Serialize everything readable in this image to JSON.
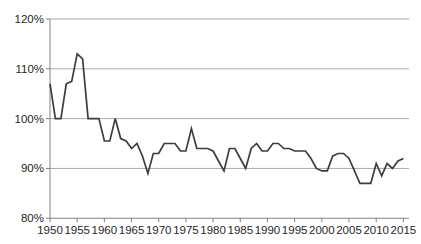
{
  "chart_data": {
    "type": "line",
    "title": "",
    "subtitle": "",
    "xlabel": "",
    "ylabel": "",
    "legend": "none",
    "grid": "horizontal",
    "ylim": [
      80,
      120
    ],
    "xlim": [
      1950,
      2015
    ],
    "y_tick_labels": [
      "120%",
      "110%",
      "100%",
      "90%",
      "80%"
    ],
    "y_tick_values": [
      120,
      110,
      100,
      90,
      80
    ],
    "x_tick_labels": [
      "1950",
      "1955",
      "1960",
      "1965",
      "1970",
      "1975",
      "1980",
      "1985",
      "1990",
      "1995",
      "2000",
      "2005",
      "2010",
      "2015"
    ],
    "x_tick_values": [
      1950,
      1955,
      1960,
      1965,
      1970,
      1975,
      1980,
      1985,
      1990,
      1995,
      2000,
      2005,
      2010,
      2015
    ],
    "x": [
      1950,
      1951,
      1952,
      1953,
      1954,
      1955,
      1956,
      1957,
      1958,
      1959,
      1960,
      1961,
      1962,
      1963,
      1964,
      1965,
      1966,
      1967,
      1968,
      1969,
      1970,
      1971,
      1972,
      1973,
      1974,
      1975,
      1976,
      1977,
      1978,
      1979,
      1980,
      1981,
      1982,
      1983,
      1984,
      1985,
      1986,
      1987,
      1988,
      1989,
      1990,
      1991,
      1992,
      1993,
      1994,
      1995,
      1996,
      1997,
      1998,
      1999,
      2000,
      2001,
      2002,
      2003,
      2004,
      2005,
      2006,
      2007,
      2008,
      2009,
      2010,
      2011,
      2012,
      2013,
      2014,
      2015
    ],
    "values": [
      107,
      100,
      100,
      107,
      107.5,
      113,
      112,
      100,
      100,
      100,
      95.5,
      95.5,
      100,
      96,
      95.5,
      94,
      95,
      92.5,
      89,
      93,
      93,
      95,
      95,
      95,
      93.5,
      93.5,
      98,
      94,
      94,
      94,
      93.5,
      91.5,
      89.5,
      94,
      94,
      92,
      90,
      94,
      95,
      93.5,
      93.5,
      95,
      95,
      94,
      94,
      93.5,
      93.5,
      93.5,
      92,
      90,
      89.5,
      89.5,
      92.5,
      93,
      93,
      92,
      89.5,
      87,
      87,
      87,
      91,
      88.5,
      91,
      90,
      91.5,
      92
    ],
    "colors": {
      "line": "#3d3d3d",
      "grid": "#ababab",
      "axis": "#808080",
      "tick": "#808080",
      "labels": "#262626",
      "background": "#ffffff"
    }
  }
}
